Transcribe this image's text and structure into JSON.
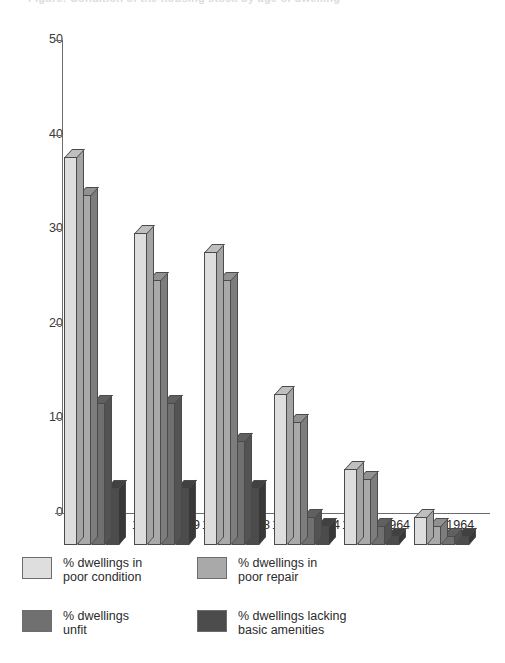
{
  "chart_data": {
    "type": "bar",
    "title": "Figure: Condition of the housing stock by age of dwelling",
    "xlabel": "",
    "ylabel": "",
    "ylim": [
      0,
      50
    ],
    "yticks": [
      0,
      10,
      20,
      30,
      40,
      50
    ],
    "grid": false,
    "legend_position": "bottom",
    "categories": [
      "Pre 1870",
      "1870—1899",
      "1900—1918",
      "1919—1944",
      "1945—1964",
      "Post 1964"
    ],
    "series": [
      {
        "name": "% dwellings in poor condition",
        "color": "#dedede",
        "values": [
          41,
          33,
          31,
          16,
          8,
          3
        ]
      },
      {
        "name": "% dwellings in poor repair",
        "color": "#a9a9a9",
        "values": [
          37,
          28,
          28,
          13,
          7,
          2
        ]
      },
      {
        "name": "% dwellings unfit",
        "color": "#707070",
        "values": [
          15,
          15,
          11,
          3,
          2,
          1
        ]
      },
      {
        "name": "% dwellings lacking basic amenities",
        "color": "#4c4c4c",
        "values": [
          6,
          6,
          6,
          2,
          1,
          1
        ]
      }
    ]
  },
  "axis": {
    "y_tick_labels": [
      "50",
      "40",
      "30",
      "20",
      "10",
      "0"
    ]
  },
  "legend": {
    "items": [
      {
        "label": "% dwellings in\npoor condition",
        "color": "#dedede"
      },
      {
        "label": "% dwellings in\npoor repair",
        "color": "#a9a9a9"
      },
      {
        "label": "% dwellings\nunfit",
        "color": "#707070"
      },
      {
        "label": "% dwellings lacking\nbasic amenities",
        "color": "#4c4c4c"
      }
    ]
  }
}
